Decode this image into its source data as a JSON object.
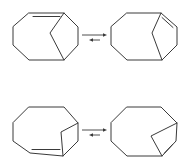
{
  "figure": {
    "description": "Two equilibria between isomeric bicyclic alkenes",
    "line_color": "#3a3a3a",
    "background": "#ffffff"
  },
  "rows": [
    {
      "label": "equilibrium-1",
      "left": {
        "name": "bicyclic-alkene-1a",
        "ring": [
          [
            29,
            13
          ],
          [
            64,
            13
          ],
          [
            78,
            27
          ],
          [
            78,
            45
          ],
          [
            64,
            60
          ],
          [
            29,
            60
          ],
          [
            13,
            45
          ],
          [
            13,
            27
          ]
        ],
        "bridge": [
          [
            64,
            13
          ],
          [
            50,
            33
          ],
          [
            64,
            60
          ]
        ],
        "double_bond_inner": [
          [
            33,
            16.5
          ],
          [
            60,
            16.5
          ]
        ]
      },
      "arrows": {
        "forward": {
          "from": [
            82,
            35
          ],
          "to": [
            107,
            35
          ]
        },
        "reverse": {
          "from": [
            100,
            40
          ],
          "to": [
            89,
            40
          ]
        }
      },
      "right": {
        "name": "bicyclic-alkene-1b",
        "ring": [
          [
            127,
            13
          ],
          [
            161,
            13
          ],
          [
            177,
            27
          ],
          [
            177,
            45
          ],
          [
            162,
            60
          ],
          [
            127,
            60
          ],
          [
            111,
            45
          ],
          [
            111,
            27
          ]
        ],
        "bridge": [
          [
            161,
            13
          ],
          [
            152,
            33
          ],
          [
            162,
            60
          ]
        ],
        "double_bond_inner": [
          [
            162,
            17.5
          ],
          [
            173,
            27.5
          ]
        ]
      }
    },
    {
      "label": "equilibrium-2",
      "left": {
        "name": "bicyclic-alkene-2a",
        "ring": [
          [
            29,
            107
          ],
          [
            64,
            107
          ],
          [
            78,
            123
          ],
          [
            78,
            141
          ],
          [
            63,
            156
          ],
          [
            30,
            153
          ],
          [
            13,
            141
          ],
          [
            13,
            123
          ]
        ],
        "bridge": [
          [
            78,
            123
          ],
          [
            61,
            132
          ],
          [
            63,
            156
          ]
        ],
        "double_bond_inner": [
          [
            32,
            149.5
          ],
          [
            60,
            149.5
          ]
        ]
      },
      "arrows": {
        "forward": {
          "from": [
            82,
            130
          ],
          "to": [
            107,
            130
          ]
        },
        "reverse": {
          "from": [
            100,
            135
          ],
          "to": [
            89,
            135
          ]
        }
      },
      "right": {
        "name": "bicyclic-alkene-2b",
        "ring": [
          [
            127,
            107
          ],
          [
            161,
            107
          ],
          [
            177,
            123
          ],
          [
            176,
            141
          ],
          [
            162,
            156
          ],
          [
            127,
            156
          ],
          [
            111,
            141
          ],
          [
            111,
            123
          ]
        ],
        "bridge": [
          [
            177,
            123
          ],
          [
            151,
            136
          ],
          [
            162,
            156
          ]
        ],
        "double_bond_inner": [
          [
            172.5,
            144.5
          ],
          [
            164.5,
            153
          ]
        ]
      }
    }
  ]
}
